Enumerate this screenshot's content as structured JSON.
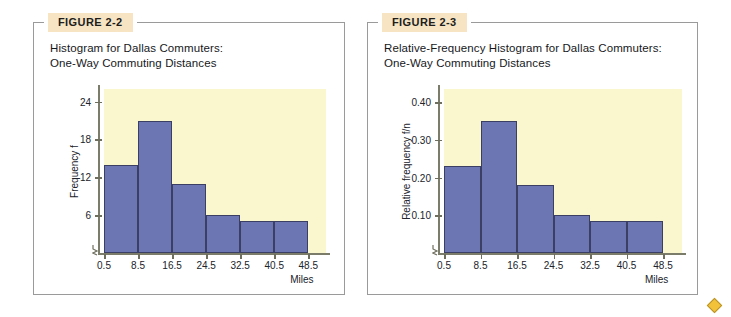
{
  "page": {
    "background": "#ffffff",
    "panel_border_color": "#9a9a9a",
    "badge_bg": "#f6e4c3",
    "plot_bg": "#faf7cf",
    "bar_fill": "#6b76b2",
    "bar_stroke": "#3a3f63",
    "marker": "diamond-marker"
  },
  "figures": [
    {
      "badge": "FIGURE 2-2",
      "title": "Histogram for Dallas Commuters:\nOne-Way Commuting Distances"
    },
    {
      "badge": "FIGURE 2-3",
      "title": "Relative-Frequency Histogram for Dallas Commuters:\nOne-Way Commuting Distances"
    }
  ],
  "chart_data": [
    {
      "type": "bar",
      "title": "Histogram for Dallas Commuters: One-Way Commuting Distances",
      "xlabel": "Miles",
      "ylabel": "Frequency f",
      "categories": [
        "0.5-8.5",
        "8.5-16.5",
        "16.5-24.5",
        "24.5-32.5",
        "32.5-40.5",
        "40.5-48.5"
      ],
      "bin_edges": [
        0.5,
        8.5,
        16.5,
        24.5,
        32.5,
        40.5,
        48.5
      ],
      "values": [
        14,
        21,
        11,
        6,
        5,
        5
      ],
      "xticks": [
        "0.5",
        "8.5",
        "16.5",
        "24.5",
        "32.5",
        "40.5",
        "48.5"
      ],
      "yticks": [
        "6",
        "12",
        "18",
        "24"
      ],
      "ytick_values": [
        6,
        12,
        18,
        24
      ],
      "ylim": [
        0,
        26
      ],
      "grid": false,
      "legend": "none"
    },
    {
      "type": "bar",
      "title": "Relative-Frequency Histogram for Dallas Commuters: One-Way Commuting Distances",
      "xlabel": "Miles",
      "ylabel": "Relative frequency f/n",
      "categories": [
        "0.5-8.5",
        "8.5-16.5",
        "16.5-24.5",
        "24.5-32.5",
        "32.5-40.5",
        "40.5-48.5"
      ],
      "bin_edges": [
        0.5,
        8.5,
        16.5,
        24.5,
        32.5,
        40.5,
        48.5
      ],
      "values": [
        0.23,
        0.35,
        0.18,
        0.1,
        0.085,
        0.085
      ],
      "xticks": [
        "0.5",
        "8.5",
        "16.5",
        "24.5",
        "32.5",
        "40.5",
        "48.5"
      ],
      "yticks": [
        "0.10",
        "0.20",
        "0.30",
        "0.40"
      ],
      "ytick_values": [
        0.1,
        0.2,
        0.3,
        0.4
      ],
      "ylim": [
        0,
        0.435
      ],
      "grid": false,
      "legend": "none"
    }
  ]
}
